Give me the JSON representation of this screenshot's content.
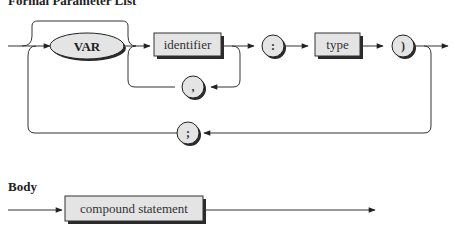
{
  "diagrams": [
    {
      "title": "Formal Parameter List",
      "nodes": [
        {
          "kind": "terminal-keyword",
          "text": "VAR"
        },
        {
          "kind": "nonterminal",
          "text": "identifier"
        },
        {
          "kind": "terminal-symbol",
          "text": ","
        },
        {
          "kind": "terminal-symbol",
          "text": ":"
        },
        {
          "kind": "nonterminal",
          "text": "type"
        },
        {
          "kind": "terminal-symbol",
          "text": ")"
        },
        {
          "kind": "terminal-symbol",
          "text": ";"
        }
      ]
    },
    {
      "title": "Body",
      "nodes": [
        {
          "kind": "nonterminal",
          "text": "compound statement"
        }
      ]
    }
  ],
  "colors": {
    "box_fill": "#e4e4e4",
    "shadow": "#2a2a2a",
    "line": "#333333"
  }
}
